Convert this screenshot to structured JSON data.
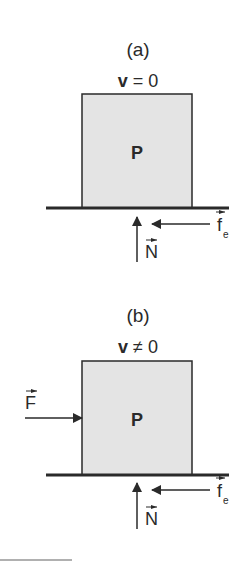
{
  "diagram": {
    "colors": {
      "stroke": "#2a2a2a",
      "block_fill": "#e4e4e4",
      "background": "#ffffff",
      "footer_line": "#b0b0b0"
    },
    "panels": [
      {
        "id": "a",
        "caption": "(a)",
        "velocity_symbol": "v",
        "velocity_relation": " = 0",
        "block_label": "P",
        "forces": [
          {
            "symbol": "N",
            "subscript": "",
            "direction": "up"
          },
          {
            "symbol": "f",
            "subscript": "e",
            "direction": "left"
          }
        ]
      },
      {
        "id": "b",
        "caption": "(b)",
        "velocity_symbol": "v",
        "velocity_relation": " ≠ 0",
        "block_label": "P",
        "forces": [
          {
            "symbol": "F",
            "subscript": "",
            "direction": "right"
          },
          {
            "symbol": "N",
            "subscript": "",
            "direction": "up"
          },
          {
            "symbol": "f",
            "subscript": "e",
            "direction": "left"
          }
        ]
      }
    ],
    "vector_arrow_glyph": "→"
  }
}
